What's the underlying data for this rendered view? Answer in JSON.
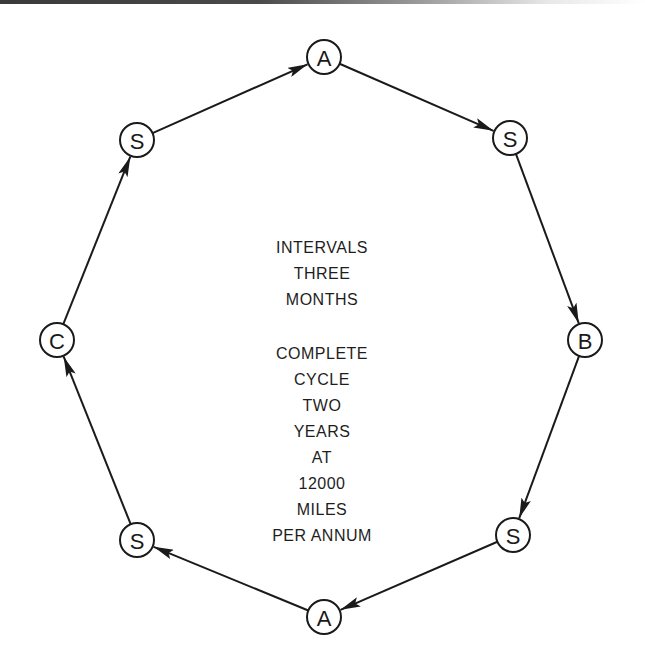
{
  "diagram": {
    "type": "cycle",
    "nodes": [
      {
        "id": "n1",
        "label": "A",
        "x": 324,
        "y": 57
      },
      {
        "id": "n2",
        "label": "S",
        "x": 510,
        "y": 138
      },
      {
        "id": "n3",
        "label": "B",
        "x": 585,
        "y": 340
      },
      {
        "id": "n4",
        "label": "S",
        "x": 513,
        "y": 535
      },
      {
        "id": "n5",
        "label": "A",
        "x": 324,
        "y": 617
      },
      {
        "id": "n6",
        "label": "S",
        "x": 137,
        "y": 540
      },
      {
        "id": "n7",
        "label": "C",
        "x": 57,
        "y": 340
      },
      {
        "id": "n8",
        "label": "S",
        "x": 137,
        "y": 140
      }
    ],
    "edges": [
      {
        "from": "n1",
        "to": "n2"
      },
      {
        "from": "n2",
        "to": "n3"
      },
      {
        "from": "n3",
        "to": "n4"
      },
      {
        "from": "n4",
        "to": "n5"
      },
      {
        "from": "n5",
        "to": "n6"
      },
      {
        "from": "n6",
        "to": "n7"
      },
      {
        "from": "n7",
        "to": "n8"
      },
      {
        "from": "n8",
        "to": "n1"
      }
    ],
    "center_text": {
      "block1": [
        "INTERVALS",
        "THREE",
        "MONTHS"
      ],
      "block2": [
        "COMPLETE",
        "CYCLE",
        "TWO",
        "YEARS",
        "AT",
        "12000",
        "MILES",
        "PER ANNUM"
      ]
    },
    "colors": {
      "line": "#1a1a1a",
      "background": "#ffffff",
      "text": "#1e1e1e"
    }
  }
}
